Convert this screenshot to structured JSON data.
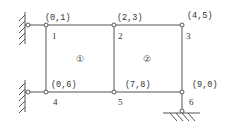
{
  "diagram": {
    "type": "structural-frame",
    "colors": {
      "line": "#555555",
      "text": "#333333",
      "background": "#ffffff"
    },
    "nodes": [
      {
        "id": "1",
        "dof": "(0,1)",
        "x": 46,
        "y": 25
      },
      {
        "id": "2",
        "dof": "(2,3)",
        "x": 114,
        "y": 25
      },
      {
        "id": "3",
        "dof": "(4,5)",
        "x": 182,
        "y": 25
      },
      {
        "id": "4",
        "dof": "(0,6)",
        "x": 46,
        "y": 92
      },
      {
        "id": "5",
        "dof": "(7,8)",
        "x": 114,
        "y": 92
      },
      {
        "id": "6",
        "dof": "(9,0)",
        "x": 182,
        "y": 92
      }
    ],
    "elements": [
      {
        "id": "①",
        "label_x": 80,
        "label_y": 62
      },
      {
        "id": "②",
        "label_x": 146,
        "label_y": 62
      }
    ],
    "supports": [
      {
        "name": "left-wall-top",
        "type": "wall-hinge"
      },
      {
        "name": "left-wall-bottom",
        "type": "wall-hinge"
      },
      {
        "name": "bottom-right-ground",
        "type": "ground-hinge"
      }
    ]
  }
}
